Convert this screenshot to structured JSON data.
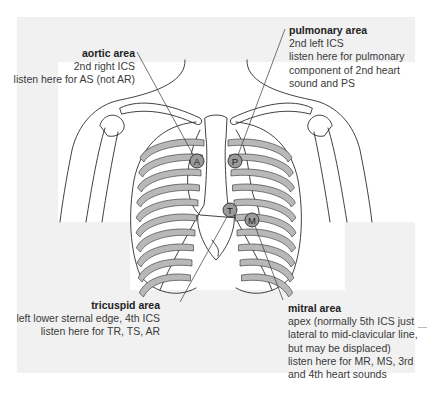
{
  "figure": {
    "colors": {
      "panel_background": "#f1f1f1",
      "illustration_background": "#ffffff",
      "line": "#2b2b2b",
      "rib_shade": "#b8b8b8",
      "marker_fill": "#9a9a9a"
    },
    "markers": [
      {
        "letter": "A",
        "name": "aortic"
      },
      {
        "letter": "P",
        "name": "pulmonary"
      },
      {
        "letter": "T",
        "name": "tricuspid"
      },
      {
        "letter": "M",
        "name": "mitral"
      }
    ],
    "annotations": {
      "aortic": {
        "title": "aortic area",
        "lines": [
          "2nd right ICS",
          "listen here for AS (not AR)"
        ]
      },
      "pulmonary": {
        "title": "pulmonary area",
        "lines": [
          "2nd left ICS",
          "listen here for pulmonary",
          "component of 2nd heart",
          "sound and PS"
        ]
      },
      "tricuspid": {
        "title": "tricuspid area",
        "lines": [
          "left lower sternal edge, 4th ICS",
          "listen here for TR, TS, AR"
        ]
      },
      "mitral": {
        "title": "mitral area",
        "lines": [
          "apex (normally 5th ICS just",
          "lateral to mid-clavicular line,",
          "but may be displaced)",
          "listen here for MR, MS, 3rd",
          "and 4th heart sounds"
        ]
      }
    }
  }
}
